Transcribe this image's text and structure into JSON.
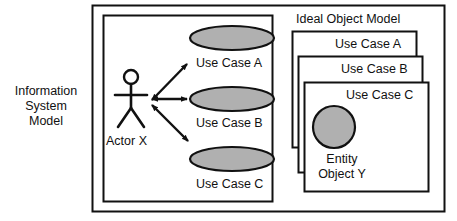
{
  "diagram": {
    "type": "uml-use-case-diagram",
    "background_color": "#ffffff",
    "stroke_color": "#111111",
    "shape_fill_color": "#b0b0b0",
    "text_color": "#111111"
  },
  "outer_frame": {
    "name": "outer-frame",
    "x": 92,
    "y": 5,
    "width": 353,
    "height": 207
  },
  "information_system_model": {
    "label": "Information\nSystem\nModel",
    "box": {
      "x": 103,
      "y": 15,
      "width": 170,
      "height": 187
    },
    "actor": {
      "label": "Actor X",
      "icon": "stick-figure-actor-icon",
      "head": {
        "cx": 131,
        "cy": 77,
        "r": 7
      }
    },
    "use_cases": [
      {
        "label": "Use Case A",
        "ellipse": {
          "cx": 232,
          "cy": 38,
          "rx": 42,
          "ry": 12
        }
      },
      {
        "label": "Use Case B",
        "ellipse": {
          "cx": 232,
          "cy": 99,
          "rx": 42,
          "ry": 12
        }
      },
      {
        "label": "Use Case C",
        "ellipse": {
          "cx": 232,
          "cy": 159,
          "rx": 42,
          "ry": 12
        }
      }
    ],
    "associations": [
      {
        "from": "Actor X",
        "to": "Use Case A",
        "arrow": "double-headed"
      },
      {
        "from": "Actor X",
        "to": "Use Case B",
        "arrow": "double-headed"
      },
      {
        "from": "Actor X",
        "to": "Use Case C",
        "arrow": "double-headed"
      }
    ]
  },
  "ideal_object_model": {
    "label": "Ideal Object Model",
    "cards": [
      {
        "label": "Use Case A",
        "box": {
          "x": 292,
          "y": 31,
          "width": 125,
          "height": 117
        }
      },
      {
        "label": "Use Case B",
        "box": {
          "x": 298,
          "y": 56,
          "width": 125,
          "height": 117
        }
      },
      {
        "label": "Use Case C",
        "box": {
          "x": 304,
          "y": 82,
          "width": 125,
          "height": 110
        }
      }
    ],
    "entity": {
      "label": "Entity\nObject Y",
      "icon": "entity-object-circle-icon",
      "circle": {
        "cx": 334,
        "cy": 127,
        "r": 21
      }
    }
  }
}
